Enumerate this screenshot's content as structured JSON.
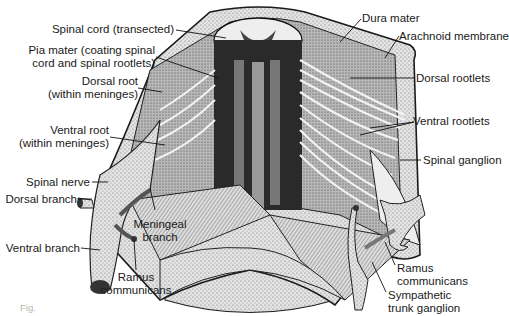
{
  "figure": {
    "caption_partial": "Fig."
  },
  "labels": {
    "spinal_cord": "Spinal cord (transected)",
    "pia_mater_1": "Pia mater (coating spinal",
    "pia_mater_2": "cord and spinal rootlets)",
    "dorsal_root_1": "Dorsal root",
    "dorsal_root_2": "(within meninges)",
    "ventral_root_1": "Ventral root",
    "ventral_root_2": "(within meninges)",
    "spinal_nerve": "Spinal nerve",
    "dorsal_branch": "Dorsal branch",
    "ventral_branch": "Ventral branch",
    "meningeal_1": "Meningeal",
    "meningeal_2": "branch",
    "ramus_left_1": "Ramus",
    "ramus_left_2": "communicans",
    "dura_mater": "Dura mater",
    "arachnoid": "Arachnoid membrane",
    "dorsal_rootlets": "Dorsal rootlets",
    "ventral_rootlets": "Ventral rootlets",
    "spinal_ganglion": "Spinal ganglion",
    "ramus_right_1": "Ramus",
    "ramus_right_2": "communicans",
    "sympathetic_1": "Sympathetic",
    "sympathetic_2": "trunk ganglion"
  },
  "colors": {
    "ink": "#1a1a1a",
    "tissue_light": "#e6e6e6",
    "tissue_mid": "#bdbdbd",
    "tissue_dark": "#3a3a3a"
  }
}
